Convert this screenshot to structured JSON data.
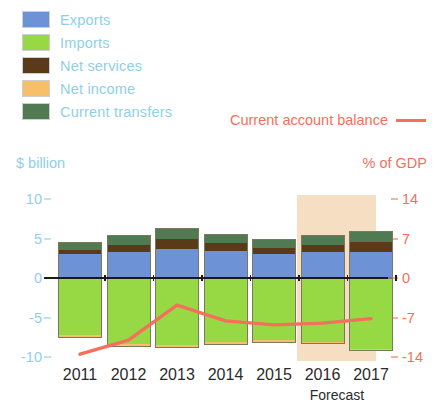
{
  "legend": {
    "items": [
      {
        "label": "Exports",
        "color": "#6e92d6",
        "name": "legend-exports"
      },
      {
        "label": "Imports",
        "color": "#96d945",
        "name": "legend-imports"
      },
      {
        "label": "Net services",
        "color": "#5a3a18",
        "name": "legend-net-services"
      },
      {
        "label": "Net income",
        "color": "#f5c069",
        "name": "legend-net-income"
      },
      {
        "label": "Current transfers",
        "color": "#4f7a52",
        "name": "legend-current-transfers"
      }
    ],
    "balance_label": "Current account balance",
    "balance_color": "#f4705c"
  },
  "axis": {
    "left_caption": "$ billion",
    "right_caption": "% of GDP",
    "left_ticks": [
      "10",
      "5",
      "0",
      "-5",
      "-10"
    ],
    "right_ticks": [
      "14",
      "7",
      "0",
      "-7",
      "-14"
    ]
  },
  "xaxis": {
    "labels": [
      "2011",
      "2012",
      "2013",
      "2014",
      "2015",
      "2016",
      "2017"
    ],
    "forecast_note": "Forecast"
  },
  "chart_data": {
    "type": "bar",
    "title": "",
    "subtitle": "",
    "xlabel": "",
    "ylabel": "$ billion",
    "y2label": "% of GDP",
    "categories": [
      "2011",
      "2012",
      "2013",
      "2014",
      "2015",
      "2016",
      "2017"
    ],
    "ylim": [
      -10,
      10
    ],
    "y2lim": [
      -14,
      14
    ],
    "yticks": [
      10,
      5,
      0,
      -5,
      -10
    ],
    "y2ticks": [
      14,
      7,
      0,
      -7,
      -14
    ],
    "grid": false,
    "legend_position": "top-left",
    "stacked": true,
    "series": [
      {
        "name": "Exports",
        "color": "#6e92d6",
        "values": [
          3.0,
          3.3,
          3.7,
          3.4,
          3.0,
          3.3,
          3.3
        ]
      },
      {
        "name": "Net services",
        "color": "#5a3a18",
        "values": [
          0.6,
          0.9,
          1.2,
          1.0,
          0.8,
          0.9,
          1.2
        ]
      },
      {
        "name": "Current transfers",
        "color": "#4f7a52",
        "values": [
          0.9,
          1.3,
          1.4,
          1.2,
          1.2,
          1.3,
          1.4
        ]
      },
      {
        "name": "Imports",
        "color": "#96d945",
        "values": [
          -7.2,
          -8.3,
          -8.5,
          -8.1,
          -7.9,
          -8.1,
          -9.0
        ]
      },
      {
        "name": "Net income",
        "color": "#f5c069",
        "values": [
          -0.4,
          -0.4,
          -0.4,
          -0.4,
          -0.3,
          -0.3,
          -0.3
        ]
      }
    ],
    "line_series": {
      "name": "Current account balance",
      "color": "#f4705c",
      "unit": "% of GDP",
      "values": [
        -13.5,
        -11.0,
        -4.8,
        -7.6,
        -8.3,
        -8.0,
        -7.2
      ]
    },
    "annotations": [
      {
        "text": "Forecast",
        "spans": [
          "2016",
          "2017"
        ],
        "shaded": true,
        "shade_color": "#f6dcc0"
      }
    ]
  }
}
